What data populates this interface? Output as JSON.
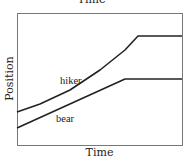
{
  "chart_data": {
    "type": "line",
    "title": "Time",
    "xlabel": "Time",
    "ylabel": "Position",
    "grid": false,
    "ticks": false,
    "series": [
      {
        "name": "hiker",
        "label_pos": [
          60,
          84
        ],
        "points": [
          [
            17,
            112
          ],
          [
            40,
            104
          ],
          [
            70,
            90
          ],
          [
            100,
            70
          ],
          [
            125,
            50
          ],
          [
            138,
            36
          ],
          [
            182,
            36
          ]
        ]
      },
      {
        "name": "bear",
        "label_pos": [
          56,
          122
        ],
        "points": [
          [
            17,
            128
          ],
          [
            125,
            79
          ],
          [
            182,
            79
          ]
        ]
      }
    ],
    "frame": {
      "left": 17,
      "top": 13,
      "right": 182,
      "bottom": 145
    }
  }
}
